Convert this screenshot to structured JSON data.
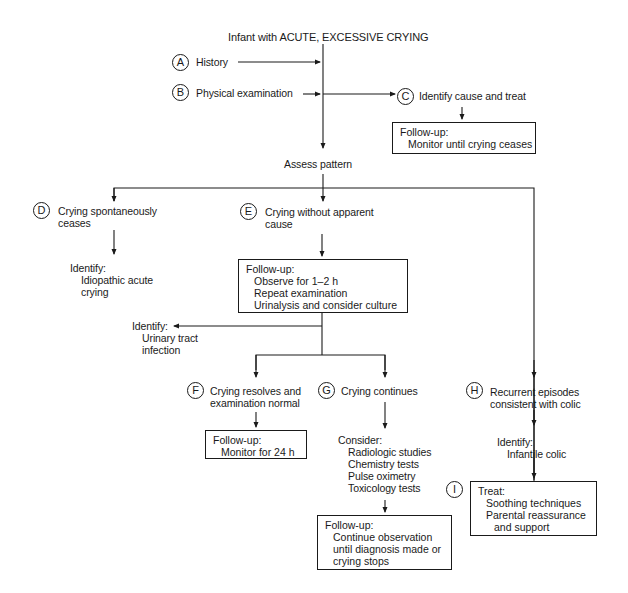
{
  "title": "Infant with ACUTE, EXCESSIVE CRYING",
  "nodes": {
    "A": {
      "letter": "A",
      "label": "History"
    },
    "B": {
      "letter": "B",
      "label": "Physical examination"
    },
    "C": {
      "letter": "C",
      "label": "Identify cause and treat",
      "box": {
        "heading": "Follow-up:",
        "items": [
          "Monitor until crying ceases"
        ]
      }
    },
    "assess": "Assess pattern",
    "D": {
      "letter": "D",
      "label_lines": [
        "Crying  spontaneously",
        "ceases"
      ],
      "identify": {
        "heading": "Identify:",
        "items": [
          "Idiopathic acute",
          "crying"
        ]
      }
    },
    "E": {
      "letter": "E",
      "label_lines": [
        "Crying without apparent",
        "cause"
      ],
      "box": {
        "heading": "Follow-up:",
        "items": [
          "Observe for 1–2 h",
          "Repeat examination",
          "Urinalysis and consider culture"
        ]
      },
      "identify": {
        "heading": "Identify:",
        "items": [
          "Urinary tract",
          "infection"
        ]
      }
    },
    "F": {
      "letter": "F",
      "label_lines": [
        "Crying resolves and",
        "examination normal"
      ],
      "box": {
        "heading": "Follow-up:",
        "items": [
          "Monitor for 24 h"
        ]
      }
    },
    "G": {
      "letter": "G",
      "label": "Crying continues",
      "consider": {
        "heading": "Consider:",
        "items": [
          "Radiologic studies",
          "Chemistry tests",
          "Pulse oximetry",
          "Toxicology tests"
        ]
      },
      "box": {
        "heading": "Follow-up:",
        "items": [
          "Continue observation",
          "until diagnosis made or",
          "crying stops"
        ]
      }
    },
    "H": {
      "letter": "H",
      "label_lines": [
        "Recurrent episodes",
        "consistent with colic"
      ],
      "identify": {
        "heading": "Identify:",
        "items": [
          "Infantile colic"
        ]
      }
    },
    "I": {
      "letter": "I",
      "box": {
        "heading": "Treat:",
        "items": [
          "Soothing techniques",
          "Parental reassurance"
        ],
        "continuation": "and support"
      }
    }
  },
  "colors": {
    "line": "#1a1a1a",
    "background": "#ffffff"
  }
}
